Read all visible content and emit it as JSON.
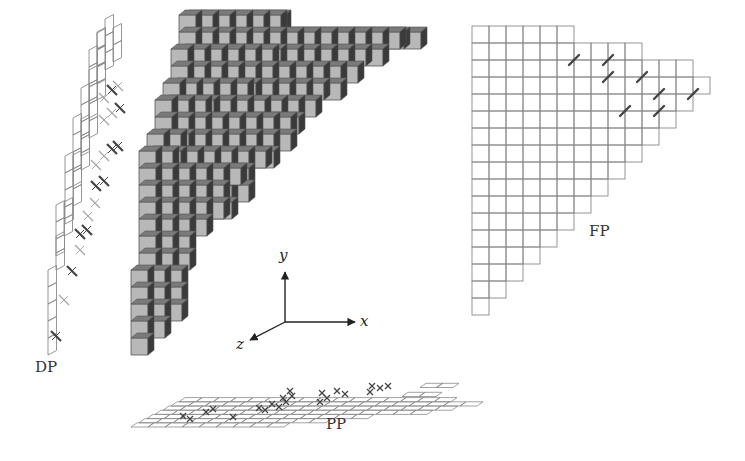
{
  "figure": {
    "labels": {
      "dp": "DP",
      "fp": "FP",
      "pp": "PP"
    },
    "axes": {
      "x": "x",
      "y": "y",
      "z": "z"
    },
    "colors": {
      "background": "#ffffff",
      "cube_front": "#b8b8b8",
      "cube_top": "#7a7a7a",
      "cube_side": "#3a3a3a",
      "cube_edge": "#555555",
      "grid_line": "#8a8a8a",
      "mark_dark": "#444444",
      "mark_light": "#aaaaaa",
      "axis": "#222222"
    },
    "fp_grid": {
      "origin": [
        472,
        26
      ],
      "cell": 17,
      "row_widths": [
        6,
        10,
        13,
        14,
        13,
        12,
        11,
        10,
        9,
        8,
        7,
        6,
        5,
        4,
        3,
        2,
        1
      ],
      "marks": [
        [
          6,
          2
        ],
        [
          8,
          2
        ],
        [
          8,
          3
        ],
        [
          10,
          3
        ],
        [
          11,
          4
        ],
        [
          13,
          4
        ],
        [
          9,
          5
        ],
        [
          11,
          5
        ]
      ]
    },
    "cube_stack": {
      "origin": [
        131,
        355
      ],
      "cell": 17,
      "depth_dx": 6,
      "depth_dy": -5,
      "layers": [
        {
          "z": 0,
          "rows": [
            [
              0,
              1
            ],
            [
              0,
              2
            ],
            [
              0,
              3
            ],
            [
              0,
              3
            ],
            [
              0,
              3
            ]
          ]
        },
        {
          "z": 1,
          "rows": [
            [
              0,
              3
            ],
            [
              0,
              3
            ],
            [
              0,
              5
            ],
            [
              0,
              6
            ],
            [
              0,
              6
            ],
            [
              0,
              6
            ],
            [
              0,
              2
            ]
          ]
        },
        {
          "z": 2,
          "rows": [
            [
              0,
              6
            ],
            [
              0,
              7
            ],
            [
              0,
              7
            ],
            [
              0,
              7
            ],
            [
              0,
              3
            ]
          ]
        },
        {
          "z": 3,
          "rows": [
            [
              0,
              8
            ],
            [
              0,
              8
            ],
            [
              0,
              8
            ],
            [
              0,
              3
            ]
          ]
        },
        {
          "z": 4,
          "rows": [
            [
              0,
              9
            ],
            [
              0,
              9
            ],
            [
              0,
              9
            ],
            [
              0,
              6
            ]
          ]
        },
        {
          "z": 5,
          "rows": [
            [
              0,
              11
            ],
            [
              0,
              11
            ],
            [
              0,
              6
            ]
          ]
        },
        {
          "z": 6,
          "rows": [
            [
              0,
              12
            ],
            [
              0,
              13
            ],
            [
              0,
              6
            ]
          ]
        },
        {
          "z": 7,
          "rows": [
            [
              0,
              14
            ],
            [
              0,
              14
            ],
            [
              0,
              6
            ]
          ]
        },
        {
          "z": 8,
          "rows": [
            [
              0,
              15
            ],
            [
              0,
              13
            ],
            [
              0,
              1
            ]
          ]
        }
      ]
    },
    "dp_strip": {
      "description": "Diagonal projection strip of skewed squares with cross marks"
    },
    "pp_plane": {
      "description": "Flattened perspective grid with cross marks"
    }
  }
}
